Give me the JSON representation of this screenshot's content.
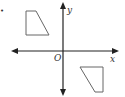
{
  "diagram": {
    "bullet": "•",
    "axes": {
      "x_label": "x",
      "y_label": "y",
      "origin_label": "O"
    },
    "shapes": [
      {
        "name": "quadrilateral-upper-left",
        "points": "26,11 36,11 49,35 26,35"
      },
      {
        "name": "quadrilateral-lower-right",
        "points": "80,67 103,67 103,92 95,92"
      }
    ],
    "colors": {
      "axis": "#222222",
      "shape": "#666666"
    }
  }
}
